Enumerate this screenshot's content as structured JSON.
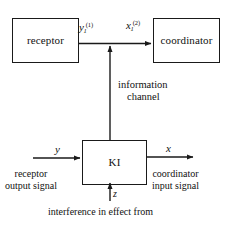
{
  "diagram": {
    "type": "block-diagram",
    "background_color": "#ffffff",
    "stroke_color": "#1a1a1a",
    "blocks": [
      {
        "id": "receptor",
        "label": "receptor"
      },
      {
        "id": "coordinator",
        "label": "coordinator"
      },
      {
        "id": "ki",
        "label": "KI"
      }
    ],
    "signals": {
      "receptor_output_symbol": "y",
      "receptor_output_subscript": "1",
      "receptor_output_superscript": "(1)",
      "coordinator_input_symbol": "x",
      "coordinator_input_subscript": "1",
      "coordinator_input_superscript": "(2)",
      "ki_input_symbol": "y",
      "ki_output_symbol": "x",
      "ki_interference_symbol": "z"
    },
    "annotations": {
      "info_channel_line1": "information",
      "info_channel_line2": "channel",
      "receptor_output_line1": "receptor",
      "receptor_output_line2": "output signal",
      "coordinator_input_line1": "coordinator",
      "coordinator_input_line2": "input signal",
      "interference_caption": "interference in effect from"
    }
  }
}
